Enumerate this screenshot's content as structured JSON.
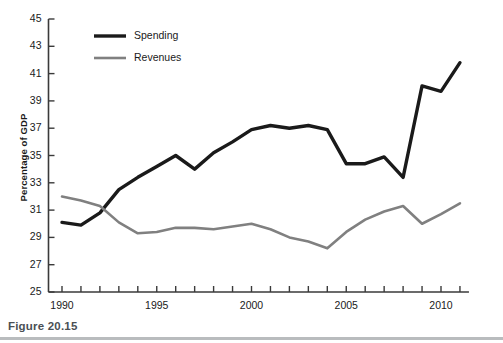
{
  "figure": {
    "caption": "Figure 20.15",
    "caption_rule_color": "#b9bcbe"
  },
  "legend": {
    "position": "top-left-inside",
    "entries": [
      {
        "label": "Spending",
        "color": "#1a1a1a",
        "width": 3.4
      },
      {
        "label": "Revenues",
        "color": "#808080",
        "width": 2.6
      }
    ]
  },
  "axes": {
    "y_title": "Percentage of GDP",
    "y_ticks": [
      "25",
      "27",
      "29",
      "31",
      "33",
      "35",
      "37",
      "39",
      "41",
      "43",
      "45"
    ],
    "x_ticks_labeled": [
      "1990",
      "1995",
      "2000",
      "2005",
      "2010"
    ]
  },
  "chart_data": {
    "type": "line",
    "title": "",
    "subtitle": "",
    "xlabel": "",
    "ylabel": "Percentage of GDP",
    "xlim": [
      1989.5,
      2011.5
    ],
    "ylim": [
      25,
      45
    ],
    "ytick_values": [
      25,
      27,
      29,
      31,
      33,
      35,
      37,
      39,
      41,
      43,
      45
    ],
    "xtick_values": [
      1990,
      1991,
      1992,
      1993,
      1994,
      1995,
      1996,
      1997,
      1998,
      1999,
      2000,
      2001,
      2002,
      2003,
      2004,
      2005,
      2006,
      2007,
      2008,
      2009,
      2010,
      2011
    ],
    "xtick_labels_shown": [
      1990,
      1995,
      2000,
      2005,
      2010
    ],
    "grid": false,
    "legend_position": "upper left",
    "x": [
      1990,
      1991,
      1992,
      1993,
      1994,
      1995,
      1996,
      1997,
      1998,
      1999,
      2000,
      2001,
      2002,
      2003,
      2004,
      2005,
      2006,
      2007,
      2008,
      2009,
      2010,
      2011
    ],
    "series": [
      {
        "name": "Spending",
        "color": "#1a1a1a",
        "values": [
          30.1,
          29.9,
          30.8,
          32.5,
          33.4,
          34.2,
          35.0,
          34.0,
          35.2,
          36.0,
          36.9,
          37.2,
          37.0,
          37.2,
          36.9,
          34.4,
          34.4,
          34.9,
          33.4,
          40.1,
          39.7,
          41.8
        ]
      },
      {
        "name": "Revenues",
        "color": "#808080",
        "values": [
          32.0,
          31.7,
          31.3,
          30.1,
          29.3,
          29.4,
          29.7,
          29.7,
          29.6,
          29.8,
          30.0,
          29.6,
          29.0,
          28.7,
          28.2,
          29.4,
          30.3,
          30.9,
          31.3,
          30.0,
          30.7,
          31.5
        ]
      }
    ]
  }
}
